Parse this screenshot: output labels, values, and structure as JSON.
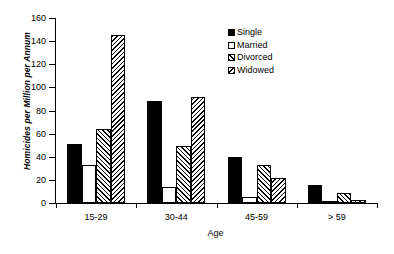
{
  "chart_data": {
    "type": "bar",
    "title": "",
    "xlabel": "Age",
    "ylabel": "Homicides per Million per Annum",
    "categories": [
      "15-29",
      "30-44",
      "45-59",
      "> 59"
    ],
    "ylim": [
      0,
      160
    ],
    "y_ticks": [
      0,
      20,
      40,
      60,
      80,
      100,
      120,
      140,
      160
    ],
    "y_tick_labels": [
      "0",
      "20",
      "40",
      "60",
      "80",
      "100",
      "120",
      "140",
      "160"
    ],
    "grid": false,
    "legend_position": "top-right-inside",
    "series": [
      {
        "name": "Single",
        "fill": "solid",
        "swatch_color": "#000000",
        "values": [
          51,
          88,
          40,
          16
        ]
      },
      {
        "name": "Married",
        "fill": "empty",
        "swatch_color": "#ffffff",
        "values": [
          33,
          14,
          5,
          1
        ]
      },
      {
        "name": "Divorced",
        "fill": "diagonal-forward",
        "swatch_color": "#ffffff",
        "values": [
          64,
          49,
          33,
          9
        ]
      },
      {
        "name": "Widowed",
        "fill": "diagonal-backward",
        "swatch_color": "#ffffff",
        "values": [
          145,
          92,
          22,
          3
        ]
      }
    ]
  }
}
